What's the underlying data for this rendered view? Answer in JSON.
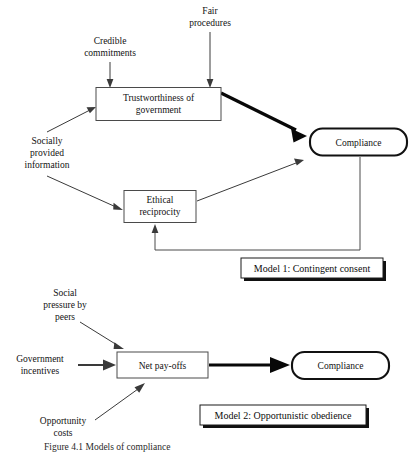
{
  "figure": {
    "caption": "Figure 4.1  Models of compliance",
    "background_color": "#ffffff",
    "ink_color": "#111111"
  },
  "model1": {
    "label": "Model 1: Contingent consent",
    "nodes": {
      "credible_commitments": "Credible\ncommitments",
      "credible_commitments_line1": "Credible",
      "credible_commitments_line2": "commitments",
      "fair_procedures_line1": "Fair",
      "fair_procedures_line2": "procedures",
      "socially_provided_line1": "Socially",
      "socially_provided_line2": "provided",
      "socially_provided_line3": "information",
      "trustworthiness_line1": "Trustworthiness of",
      "trustworthiness_line2": "government",
      "ethical_line1": "Ethical",
      "ethical_line2": "reciprocity",
      "compliance": "Compliance"
    },
    "edges": [
      {
        "name": "credible-commitments-to-trustworthiness",
        "from": "Credible commitments",
        "to": "Trustworthiness of government",
        "weight": "thin"
      },
      {
        "name": "fair-procedures-to-trustworthiness",
        "from": "Fair procedures",
        "to": "Trustworthiness of government",
        "weight": "thin"
      },
      {
        "name": "socially-provided-to-trustworthiness",
        "from": "Socially provided information",
        "to": "Trustworthiness of government",
        "weight": "thin"
      },
      {
        "name": "socially-provided-to-ethical",
        "from": "Socially provided information",
        "to": "Ethical reciprocity",
        "weight": "thin"
      },
      {
        "name": "trustworthiness-to-compliance",
        "from": "Trustworthiness of government",
        "to": "Compliance",
        "weight": "thick"
      },
      {
        "name": "ethical-to-compliance",
        "from": "Ethical reciprocity",
        "to": "Compliance",
        "weight": "thin"
      },
      {
        "name": "compliance-feedback-to-ethical",
        "from": "Compliance",
        "to": "Ethical reciprocity",
        "weight": "thin"
      }
    ]
  },
  "model2": {
    "label": "Model 2: Opportunistic obedience",
    "nodes": {
      "social_pressure_line1": "Social",
      "social_pressure_line2": "pressure by",
      "social_pressure_line3": "peers",
      "government_incentives_line1": "Government",
      "government_incentives_line2": "incentives",
      "opportunity_costs_line1": "Opportunity",
      "opportunity_costs_line2": "costs",
      "net_payoffs": "Net pay-offs",
      "compliance": "Compliance"
    },
    "edges": [
      {
        "name": "social-pressure-to-net-payoffs",
        "from": "Social pressure by peers",
        "to": "Net pay-offs",
        "weight": "thin"
      },
      {
        "name": "government-incentives-to-net-payoffs",
        "from": "Government incentives",
        "to": "Net pay-offs",
        "weight": "medium"
      },
      {
        "name": "opportunity-costs-to-net-payoffs",
        "from": "Opportunity costs",
        "to": "Net pay-offs",
        "weight": "thin"
      },
      {
        "name": "net-payoffs-to-compliance",
        "from": "Net pay-offs",
        "to": "Compliance",
        "weight": "thick"
      }
    ]
  }
}
